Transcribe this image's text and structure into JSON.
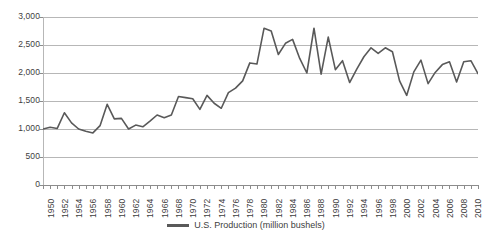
{
  "chart_data": {
    "type": "line",
    "title": "",
    "xlabel": "",
    "ylabel": "",
    "ylim": [
      0,
      3000
    ],
    "ytick_labels": [
      "3,000",
      "2,500",
      "2,000",
      "1,500",
      "1,000",
      "500",
      "0"
    ],
    "ytick_values": [
      3000,
      2500,
      2000,
      1500,
      1000,
      500,
      0
    ],
    "grid": true,
    "legend_position": "bottom-center",
    "xlim": [
      1950,
      2011
    ],
    "xtick_interval_years": 1,
    "xtick_label_interval_years": 2,
    "xtick_labels": [
      "1950",
      "1952",
      "1954",
      "1956",
      "1958",
      "1960",
      "1962",
      "1964",
      "1966",
      "1968",
      "1970",
      "1972",
      "1974",
      "1976",
      "1978",
      "1980",
      "1982",
      "1984",
      "1986",
      "1988",
      "1990",
      "1992",
      "1994",
      "1996",
      "1998",
      "2000",
      "2002",
      "2004",
      "2006",
      "2008",
      "2010"
    ],
    "series": [
      {
        "name": "U.S. Production (million bushels)",
        "color": "#595959",
        "x": [
          1950,
          1951,
          1952,
          1953,
          1954,
          1955,
          1956,
          1957,
          1958,
          1959,
          1960,
          1961,
          1962,
          1963,
          1964,
          1965,
          1966,
          1967,
          1968,
          1969,
          1970,
          1971,
          1972,
          1973,
          1974,
          1975,
          1976,
          1977,
          1978,
          1979,
          1980,
          1981,
          1982,
          1983,
          1984,
          1985,
          1986,
          1987,
          1988,
          1989,
          1990,
          1991,
          1992,
          1993,
          1994,
          1995,
          1996,
          1997,
          1998,
          1999,
          2000,
          2001,
          2002,
          2003,
          2004,
          2005,
          2006,
          2007,
          2008,
          2009,
          2010,
          2011
        ],
        "values": [
          1000,
          1030,
          1010,
          1290,
          1110,
          1000,
          960,
          930,
          1060,
          1440,
          1180,
          1190,
          1000,
          1070,
          1040,
          1140,
          1250,
          1200,
          1250,
          1580,
          1560,
          1540,
          1350,
          1600,
          1460,
          1370,
          1650,
          1730,
          1860,
          2180,
          2160,
          2800,
          2750,
          2330,
          2530,
          2600,
          2260,
          2000,
          2800,
          1980,
          2640,
          2060,
          2220,
          1830,
          2070,
          2290,
          2450,
          2350,
          2450,
          2380,
          1860,
          1600,
          2020,
          2230,
          1810,
          2010,
          2150,
          2200,
          1840,
          2200,
          2220,
          1990
        ],
        "units": "million bushels"
      }
    ]
  },
  "legend": {
    "entries": [
      {
        "label": "U.S. Production (million bushels)",
        "color": "#595959"
      }
    ]
  },
  "axes": {
    "y_axis_name": "production-axis",
    "x_axis_name": "year-axis"
  }
}
